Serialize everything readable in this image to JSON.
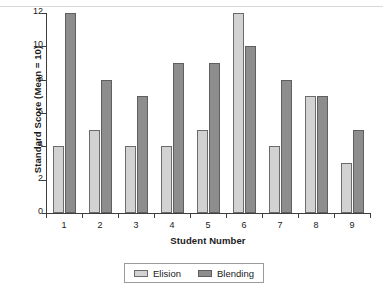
{
  "chart_data": {
    "type": "bar",
    "title": "",
    "xlabel": "Student Number",
    "ylabel": "Standard Score (Mean = 10)",
    "categories": [
      "1",
      "2",
      "3",
      "4",
      "5",
      "6",
      "7",
      "8",
      "9"
    ],
    "series": [
      {
        "name": "Elision",
        "color": "#d2d2d2",
        "values": [
          4,
          5,
          4,
          4,
          5,
          12,
          4,
          7,
          3
        ]
      },
      {
        "name": "Blending",
        "color": "#8d8d8d",
        "values": [
          12,
          8,
          7,
          9,
          9,
          10,
          8,
          7,
          5
        ]
      }
    ],
    "ylim": [
      0,
      12
    ],
    "yticks": [
      0,
      2,
      4,
      6,
      8,
      10,
      12
    ],
    "ytick_labels": [
      "0",
      "2",
      "4",
      "6",
      "8",
      "10",
      "12"
    ],
    "grid": false,
    "legend_position": "bottom-center",
    "legend_entries": [
      "Elision",
      "Blending"
    ]
  }
}
